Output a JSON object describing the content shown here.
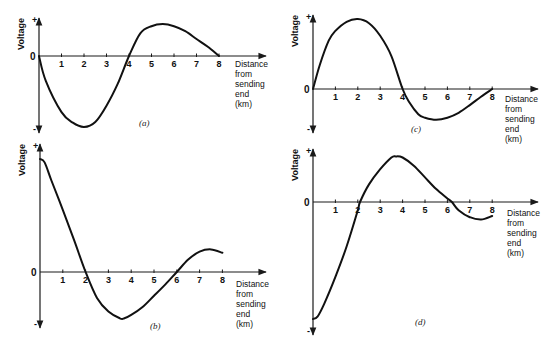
{
  "figure": {
    "y_axis_label": "Voltage",
    "plus_sign": "+",
    "minus_sign": "-",
    "zero_label": "0",
    "x_axis_label_lines": [
      "Distance",
      "from",
      "sending",
      "end",
      "(km)"
    ]
  },
  "chart_data": [
    {
      "id": "a",
      "type": "line",
      "title": "(a)",
      "xlabel": "Distance from sending end (km)",
      "ylabel": "Voltage",
      "xlim": [
        0,
        8
      ],
      "ylim": [
        -1,
        1
      ],
      "x_ticks": [
        1,
        2,
        3,
        4,
        5,
        6,
        7,
        8
      ],
      "y_ticks": [
        "+",
        "0",
        "-"
      ],
      "grid": false,
      "series": [
        {
          "name": "voltage",
          "x": [
            0,
            0.3,
            1,
            1.5,
            2,
            2.5,
            3,
            3.5,
            4,
            4.5,
            5,
            5.5,
            6,
            6.5,
            7,
            7.5,
            8
          ],
          "y": [
            0,
            -0.35,
            -0.79,
            -0.94,
            -1.0,
            -0.93,
            -0.7,
            -0.39,
            0,
            0.32,
            0.42,
            0.45,
            0.42,
            0.35,
            0.24,
            0.13,
            0
          ]
        }
      ]
    },
    {
      "id": "b",
      "type": "line",
      "title": "(b)",
      "xlabel": "Distance from sending end (km)",
      "ylabel": "Voltage",
      "xlim": [
        0,
        8
      ],
      "ylim": [
        -1,
        1
      ],
      "x_ticks": [
        1,
        2,
        3,
        4,
        5,
        6,
        7,
        8
      ],
      "y_ticks": [
        "+",
        "0",
        "-"
      ],
      "grid": false,
      "series": [
        {
          "name": "voltage",
          "x": [
            0,
            0.2,
            0.5,
            1,
            1.5,
            2,
            2.5,
            3,
            3.5,
            3.7,
            4,
            4.5,
            5,
            5.5,
            6,
            6.5,
            7,
            7.5,
            8
          ],
          "y": [
            1.0,
            0.97,
            0.81,
            0.55,
            0.28,
            0,
            -0.23,
            -0.35,
            -0.41,
            -0.41,
            -0.38,
            -0.31,
            -0.21,
            -0.11,
            0,
            0.11,
            0.18,
            0.2,
            0.17
          ]
        }
      ]
    },
    {
      "id": "c",
      "type": "line",
      "title": "(c)",
      "xlabel": "Distance from sending end (km)",
      "ylabel": "Voltage",
      "xlim": [
        0,
        8
      ],
      "ylim": [
        -1,
        1
      ],
      "x_ticks": [
        1,
        2,
        3,
        4,
        5,
        6,
        7,
        8
      ],
      "y_ticks": [
        "+",
        "0",
        "-"
      ],
      "grid": false,
      "series": [
        {
          "name": "voltage",
          "x": [
            0,
            0.3,
            0.7,
            1,
            1.5,
            2,
            2.5,
            3,
            3.5,
            4,
            4.3,
            4.7,
            5,
            5.5,
            6,
            6.5,
            7,
            7.5,
            8
          ],
          "y": [
            0,
            0.34,
            0.69,
            0.83,
            0.96,
            1.0,
            0.94,
            0.76,
            0.47,
            0,
            -0.19,
            -0.36,
            -0.41,
            -0.44,
            -0.41,
            -0.34,
            -0.23,
            -0.11,
            0
          ]
        }
      ]
    },
    {
      "id": "d",
      "type": "line",
      "title": "(d)",
      "xlabel": "Distance from sending end (km)",
      "ylabel": "Voltage",
      "xlim": [
        0,
        8
      ],
      "ylim": [
        -1,
        1
      ],
      "x_ticks": [
        1,
        2,
        3,
        4,
        5,
        6,
        7,
        8
      ],
      "y_ticks": [
        "+",
        "0",
        "-"
      ],
      "grid": false,
      "series": [
        {
          "name": "voltage",
          "x": [
            0,
            0.2,
            0.5,
            1,
            1.5,
            2,
            2.1,
            2.5,
            3,
            3.5,
            3.7,
            4,
            4.5,
            5,
            5.5,
            6,
            6.2,
            6.5,
            7,
            7.5,
            8
          ],
          "y": [
            -1.0,
            -0.98,
            -0.87,
            -0.64,
            -0.38,
            -0.07,
            0,
            0.15,
            0.28,
            0.38,
            0.39,
            0.38,
            0.31,
            0.21,
            0.11,
            0.03,
            0,
            -0.07,
            -0.13,
            -0.15,
            -0.12
          ]
        }
      ]
    }
  ],
  "layout": {
    "panels": [
      {
        "id": "a",
        "ox": 39,
        "oy": 56,
        "pxPerKm": 22.5,
        "amp": 71,
        "yTop": 18,
        "yBottom": 133,
        "xEnd": 266,
        "label": [
          139,
          126
        ],
        "dlabel": [
          235,
          67
        ]
      },
      {
        "id": "b",
        "ox": 40,
        "oy": 272,
        "pxPerKm": 22.8,
        "amp": 113,
        "yTop": 144,
        "yBottom": 328,
        "xEnd": 266,
        "label": [
          150,
          329
        ],
        "dlabel": [
          236,
          287
        ]
      },
      {
        "id": "c",
        "ox": 313,
        "oy": 89,
        "pxPerKm": 22.4,
        "amp": 70,
        "yTop": 15,
        "yBottom": 133,
        "xEnd": 538,
        "label": [
          411,
          132
        ],
        "dlabel": [
          505,
          102
        ]
      },
      {
        "id": "d",
        "ox": 313,
        "oy": 202,
        "pxPerKm": 22.4,
        "amp": 117,
        "yTop": 149,
        "yBottom": 335,
        "xEnd": 538,
        "label": [
          415,
          325
        ],
        "dlabel": [
          507,
          216
        ]
      }
    ]
  }
}
